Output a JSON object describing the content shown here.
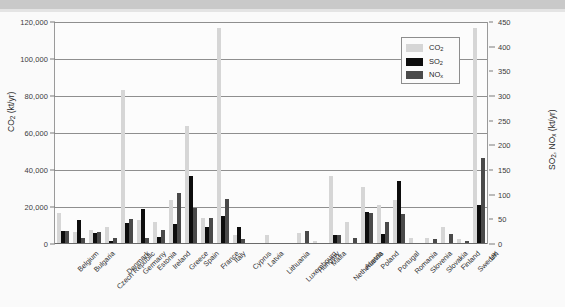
{
  "chart_data": {
    "type": "bar",
    "title": "",
    "xlabel": "",
    "ylabel": "CO2 (kt/yr)",
    "ylabel_left_html": "CO₂ (kt/yr)",
    "ylabel_right_html": "SO₂, NOₓ (kt/yr)",
    "ylim": [
      0,
      120000
    ],
    "y2lim": [
      0,
      450
    ],
    "grid": true,
    "legend_position": "top-right",
    "left_axis_ticks": [
      "0",
      "20,000",
      "40,000",
      "60,000",
      "80,000",
      "100,000",
      "120,000"
    ],
    "left_axis_tick_values": [
      0,
      20000,
      40000,
      60000,
      80000,
      100000,
      120000
    ],
    "right_axis_ticks": [
      "0",
      "50",
      "100",
      "150",
      "200",
      "250",
      "300",
      "350",
      "400",
      "450"
    ],
    "right_axis_tick_values": [
      0,
      50,
      100,
      150,
      200,
      250,
      300,
      350,
      400,
      450
    ],
    "categories": [
      "Belgium",
      "Bulgaria",
      "Czech Republic",
      "Denmark",
      "Germany",
      "Estonia",
      "Ireland",
      "Greece",
      "Spain",
      "France",
      "Italy",
      "Cyprus",
      "Latvia",
      "Lithuania",
      "Luxembourg",
      "Hungary",
      "Malta",
      "Netherlands",
      "Austria",
      "Poland",
      "Portugal",
      "Romania",
      "Slovenia",
      "Slovakia",
      "Finland",
      "Sweden",
      "UK"
    ],
    "series": [
      {
        "name": "CO2",
        "label_html": "CO₂",
        "axis": "left",
        "unit": "kt/yr",
        "color": "#d6d6d6",
        "values": [
          16500,
          6300,
          7400,
          9400,
          83000,
          13200,
          12000,
          23800,
          64000,
          13800,
          117000,
          4800,
          500,
          4700,
          300,
          6200,
          1800,
          37000,
          12100,
          31000,
          21000,
          24000,
          3200,
          3000,
          9000,
          2900,
          116500
        ]
      },
      {
        "name": "SO2",
        "label_html": "SO₂",
        "axis": "right",
        "unit": "kt/yr",
        "color": "#0d0d0d",
        "values": [
          26,
          48,
          23,
          7,
          42,
          70,
          14,
          40,
          137,
          34,
          57,
          35,
          1,
          0,
          0,
          0,
          0,
          18,
          3,
          64,
          21,
          127,
          1,
          2,
          3,
          2,
          79
        ]
      },
      {
        "name": "NOx",
        "label_html": "NOₓ",
        "axis": "right",
        "unit": "kt/yr",
        "color": "#4a4a4a",
        "values": [
          27,
          12,
          25,
          13,
          51,
          12,
          29,
          104,
          72,
          52,
          91,
          11,
          2,
          0,
          1,
          26,
          3,
          19,
          12,
          63,
          45,
          61,
          1,
          11,
          20,
          7,
          175
        ]
      }
    ]
  },
  "legend": {
    "items": [
      {
        "label_html": "CO₂",
        "color": "#d6d6d6"
      },
      {
        "label_html": "SO₂",
        "color": "#0d0d0d"
      },
      {
        "label_html": "NOₓ",
        "color": "#4a4a4a"
      }
    ]
  }
}
